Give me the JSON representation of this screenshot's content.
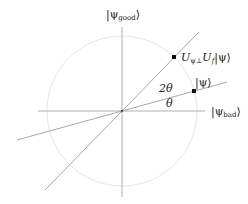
{
  "diagram": {
    "axes": {
      "vertical_label": "|ψ",
      "vertical_sub": "good",
      "horizontal_label": "|ψ",
      "horizontal_sub": "bad",
      "ket_close": "⟩",
      "ket_open": "|"
    },
    "vectors": {
      "psi_label": "|ψ⟩",
      "rotated_label_U1": "U",
      "rotated_sub1": "ψ⊥",
      "rotated_label_U2": "U",
      "rotated_sub2": "f",
      "rotated_label_ket": "|ψ⟩"
    },
    "angles": {
      "theta": "θ",
      "two_theta": "2θ"
    },
    "colors": {
      "axis": "#b0b0b0",
      "circle": "#e6e6e6",
      "line": "#a8a8a8",
      "point": "#111111"
    }
  }
}
